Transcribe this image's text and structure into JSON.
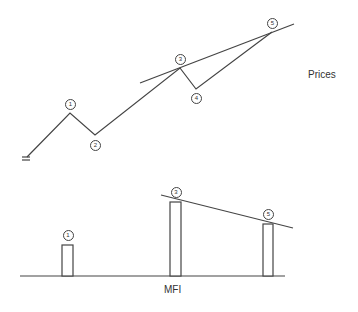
{
  "labels": {
    "prices": "Prices",
    "mfi": "MFI"
  },
  "price_points": [
    {
      "id": "start",
      "x": 27,
      "y": 157
    },
    {
      "id": "1",
      "x": 70,
      "y": 113,
      "label": "1"
    },
    {
      "id": "2",
      "x": 95,
      "y": 135,
      "label": "2"
    },
    {
      "id": "3",
      "x": 180,
      "y": 68,
      "label": "3"
    },
    {
      "id": "4",
      "x": 196,
      "y": 89,
      "label": "4"
    },
    {
      "id": "5",
      "x": 272,
      "y": 32,
      "label": "5"
    }
  ],
  "price_trendline": {
    "x1": 140,
    "y1": 83,
    "x2": 294,
    "y2": 24
  },
  "mfi_baseline": {
    "x1": 20,
    "x2": 285,
    "y": 276
  },
  "mfi_bars": [
    {
      "label": "1",
      "x": 62,
      "width": 11,
      "top": 245
    },
    {
      "label": "3",
      "x": 170,
      "width": 11,
      "top": 202
    },
    {
      "label": "5",
      "x": 263,
      "width": 10,
      "top": 224
    }
  ],
  "mfi_trendline": {
    "x1": 161,
    "y1": 195,
    "x2": 293,
    "y2": 228
  },
  "colors": {
    "line": "#444444",
    "background": "#ffffff"
  }
}
